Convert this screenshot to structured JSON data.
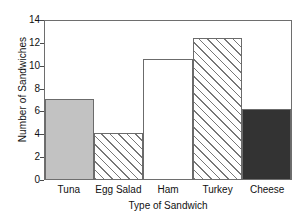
{
  "chart_data": {
    "type": "bar",
    "title": "",
    "xlabel": "Type of Sandwich",
    "ylabel": "Number of Sandwiches",
    "categories": [
      "Tuna",
      "Egg Salad",
      "Ham",
      "Turkey",
      "Cheese"
    ],
    "values": [
      7,
      4,
      10.5,
      12.3,
      6.1
    ],
    "ylim": [
      0,
      14
    ],
    "yticks": [
      0,
      2,
      4,
      6,
      8,
      10,
      12,
      14
    ],
    "ytick_labels": [
      "0",
      "2",
      "4",
      "6",
      "8",
      "10",
      "12",
      "14"
    ],
    "grid": false,
    "legend": "none",
    "bar_styles": [
      "solid-gray",
      "hatch-diagonal",
      "white",
      "hatch-diagonal",
      "solid-dark"
    ],
    "colors": {
      "solid_gray": "#c2c2c2",
      "white": "#ffffff",
      "solid_dark": "#333333",
      "hatch_line": "#777777",
      "bar_outline": "#6b6b6b",
      "axis": "#6e6e6e",
      "text": "#111111"
    }
  }
}
